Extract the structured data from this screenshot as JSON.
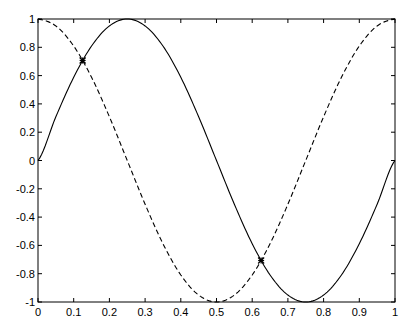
{
  "chart_data": {
    "type": "line",
    "title": "",
    "xlabel": "",
    "ylabel": "",
    "xlim": [
      0,
      1
    ],
    "ylim": [
      -1,
      1
    ],
    "grid": false,
    "legend": null,
    "x_ticks": [
      "0",
      "0.1",
      "0.2",
      "0.3",
      "0.4",
      "0.5",
      "0.6",
      "0.7",
      "0.8",
      "0.9",
      "1"
    ],
    "y_ticks": [
      "-1",
      "-0.8",
      "-0.6",
      "-0.4",
      "-0.2",
      "0",
      "0.2",
      "0.4",
      "0.6",
      "0.8",
      "1"
    ],
    "series": [
      {
        "name": "sin(2πx)",
        "style": "solid",
        "color": "#000000",
        "x": [
          0,
          0.05,
          0.1,
          0.15,
          0.2,
          0.25,
          0.3,
          0.35,
          0.4,
          0.45,
          0.5,
          0.55,
          0.6,
          0.65,
          0.7,
          0.75,
          0.8,
          0.85,
          0.9,
          0.95,
          1
        ],
        "values": [
          0,
          0.309,
          0.588,
          0.809,
          0.951,
          1,
          0.951,
          0.809,
          0.588,
          0.309,
          0,
          -0.309,
          -0.588,
          -0.809,
          -0.951,
          -1,
          -0.951,
          -0.809,
          -0.588,
          -0.309,
          0
        ]
      },
      {
        "name": "cos(2πx)",
        "style": "dashed",
        "color": "#000000",
        "x": [
          0,
          0.05,
          0.1,
          0.15,
          0.2,
          0.25,
          0.3,
          0.35,
          0.4,
          0.45,
          0.5,
          0.55,
          0.6,
          0.65,
          0.7,
          0.75,
          0.8,
          0.85,
          0.9,
          0.95,
          1
        ],
        "values": [
          1,
          0.951,
          0.809,
          0.588,
          0.309,
          0,
          -0.309,
          -0.588,
          -0.809,
          -0.951,
          -1,
          -0.951,
          -0.809,
          -0.588,
          -0.309,
          0,
          0.309,
          0.588,
          0.809,
          0.951,
          1
        ]
      }
    ],
    "markers": [
      {
        "x": 0.125,
        "y": 0.707,
        "symbol": "*"
      },
      {
        "x": 0.625,
        "y": -0.707,
        "symbol": "*"
      }
    ]
  }
}
